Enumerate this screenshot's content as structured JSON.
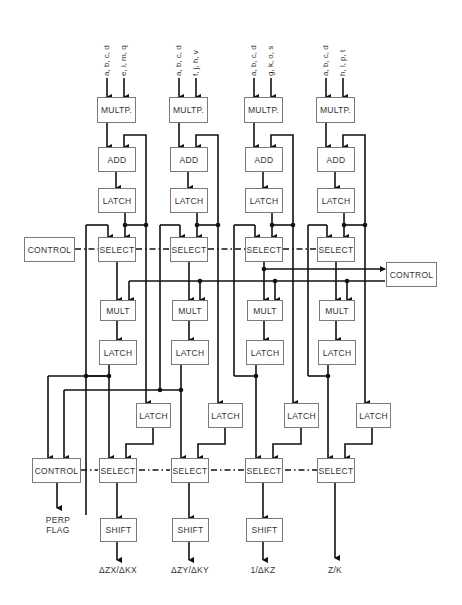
{
  "diagram": {
    "columns": [
      {
        "inputs": [
          "a, b, c, d",
          "e, i, m, q"
        ]
      },
      {
        "inputs": [
          "a, b, c, d",
          "f, j, h, v"
        ]
      },
      {
        "inputs": [
          "a, b, c, d",
          "g, k, o, s"
        ]
      },
      {
        "inputs": [
          "a, b, c, d",
          "h, l, p, t"
        ]
      }
    ],
    "blocks": {
      "multp": "MULTP.",
      "add": "ADD",
      "latch": "LATCH",
      "select": "SELECT",
      "mult": "MULT",
      "shift": "SHIFT",
      "control": "CONTROL"
    },
    "outputs": {
      "perp_flag_line1": "PERP",
      "perp_flag_line2": "FLAG",
      "out1": "ΔZX/ΔKX",
      "out2": "ΔZY/ΔKY",
      "out3": "1/ΔKZ",
      "out4": "Z/K"
    },
    "colors": {
      "line": "#111111",
      "box_border": "#7a7a7a",
      "text": "#333333"
    }
  }
}
